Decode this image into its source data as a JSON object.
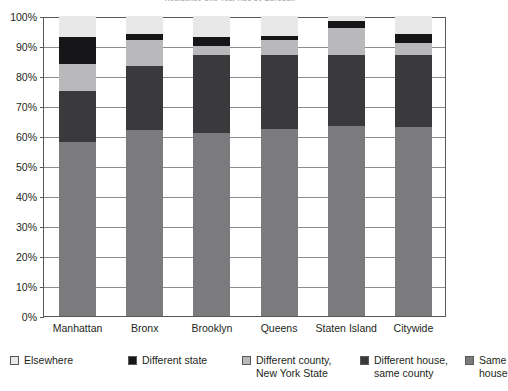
{
  "chart_data": {
    "type": "bar",
    "subtype": "stacked-bar-100-percent",
    "title": "Residence One Year Ago by Borough",
    "xlabel": "",
    "ylabel": "",
    "ylim": [
      0,
      100
    ],
    "ytick_labels": [
      "0%",
      "10%",
      "20%",
      "30%",
      "40%",
      "50%",
      "60%",
      "70%",
      "80%",
      "90%",
      "100%"
    ],
    "ytick_values": [
      0,
      10,
      20,
      30,
      40,
      50,
      60,
      70,
      80,
      90,
      100
    ],
    "grid": true,
    "legend_position": "bottom",
    "categories": [
      "Manhattan",
      "Bronx",
      "Brooklyn",
      "Queens",
      "Staten Island",
      "Citywide"
    ],
    "series": [
      {
        "name": "Same house",
        "color": "#7b7b7e",
        "values": [
          58.0,
          62.0,
          61.0,
          62.5,
          63.5,
          63.0
        ]
      },
      {
        "name": "Different house,\nsame county",
        "color": "#3a3a3d",
        "values": [
          17.0,
          21.5,
          26.0,
          24.5,
          23.5,
          24.0
        ]
      },
      {
        "name": "Different county,\nNew York State",
        "color": "#b9b9bb",
        "values": [
          9.0,
          8.5,
          3.0,
          5.0,
          9.0,
          4.0
        ]
      },
      {
        "name": "Different state",
        "color": "#161619",
        "values": [
          9.0,
          2.0,
          3.0,
          1.5,
          2.5,
          3.0
        ]
      },
      {
        "name": "Elsewhere",
        "color": "#e8e8e8",
        "values": [
          7.0,
          6.0,
          7.0,
          6.5,
          1.5,
          6.0
        ]
      }
    ],
    "legend_entries": [
      {
        "label": "Elsewhere",
        "color": "#e8e8e8"
      },
      {
        "label": "Different state",
        "color": "#161619"
      },
      {
        "label": "Different county,\nNew York State",
        "color": "#b9b9bb"
      },
      {
        "label": "Different house,\nsame county",
        "color": "#3a3a3d"
      },
      {
        "label": "Same house",
        "color": "#7b7b7e"
      }
    ],
    "axis_color": "#58585b",
    "grid_color": "#8c8c90"
  }
}
